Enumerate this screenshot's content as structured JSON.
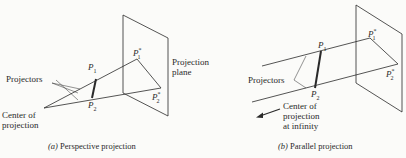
{
  "figure": {
    "panel_a": {
      "caption_letter": "(a)",
      "caption_text": "Perspective projection",
      "labels": {
        "projectors": "Projectors",
        "center": "Center of",
        "center2": "projection",
        "plane": "Projection",
        "plane2": "plane",
        "p1": "P",
        "p1_sub": "1",
        "p2": "P",
        "p2_sub": "2",
        "p1s": "P",
        "p1s_sub": "1",
        "p1s_sup": "*",
        "p2s": "P",
        "p2s_sub": "2",
        "p2s_sup": "*"
      }
    },
    "panel_b": {
      "caption_letter": "(b)",
      "caption_text": "Parallel projection",
      "labels": {
        "projectors": "Projectors",
        "center": "Center of",
        "center2": "projection",
        "center3": "at infinity",
        "p1": "P",
        "p1_sub": "1",
        "p2": "P",
        "p2_sub": "2",
        "p1s": "P",
        "p1s_sub": "1",
        "p1s_sup": "*",
        "p2s": "P",
        "p2s_sub": "2",
        "p2s_sup": "*"
      }
    },
    "colors": {
      "line": "#2a2a2a",
      "background": "#fbfbf9"
    }
  }
}
